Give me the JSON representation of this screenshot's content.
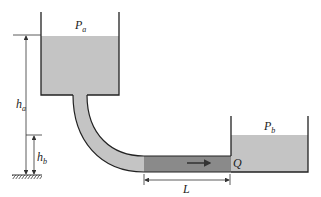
{
  "diagram": {
    "type": "two-tank pipe flow",
    "labels": {
      "pa_main": "P",
      "pa_sub": "a",
      "pb_main": "P",
      "pb_sub": "b",
      "ha_main": "h",
      "ha_sub": "a",
      "hb_main": "h",
      "hb_sub": "b",
      "q": "Q",
      "l": "L"
    },
    "colors": {
      "water": "#c4c4c4",
      "pipe_section": "#8a8a8a",
      "outline": "#222222",
      "dimension": "#333333"
    }
  }
}
